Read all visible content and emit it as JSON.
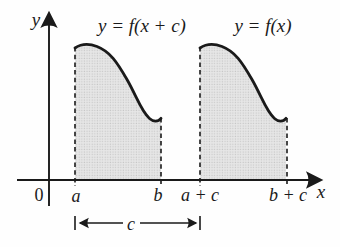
{
  "figure": {
    "axis": {
      "y_label": "y",
      "x_label": "x",
      "origin_label": "0"
    },
    "curves": [
      {
        "label": "y = f(x + c)",
        "interval_start": "a",
        "interval_end": "b"
      },
      {
        "label": "y = f(x)",
        "interval_start": "a + c",
        "interval_end": "b + c"
      }
    ],
    "shift_arrow": {
      "label": "c"
    },
    "colors": {
      "ink": "#1a1a1a",
      "shade": "#e7e7e7",
      "shade_dot": "#c7c7c7",
      "background": "#fefefe"
    }
  }
}
